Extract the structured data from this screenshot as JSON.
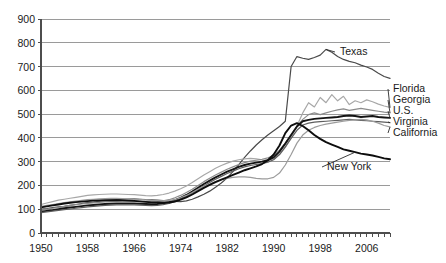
{
  "chart_data": {
    "type": "line",
    "title": "",
    "xlabel": "",
    "ylabel": "",
    "xlim": [
      1950,
      2010
    ],
    "ylim": [
      0,
      900
    ],
    "grid": true,
    "legend_position": "right-inline-labels",
    "y_ticks": [
      0,
      100,
      200,
      300,
      400,
      500,
      600,
      700,
      800,
      900
    ],
    "x_ticks_labeled": [
      1950,
      1958,
      1966,
      1974,
      1982,
      1990,
      1998,
      2006
    ],
    "x_tick_step_minor": 1,
    "x": [
      1950,
      1951,
      1952,
      1953,
      1954,
      1955,
      1956,
      1957,
      1958,
      1959,
      1960,
      1961,
      1962,
      1963,
      1964,
      1965,
      1966,
      1967,
      1968,
      1969,
      1970,
      1971,
      1972,
      1973,
      1974,
      1975,
      1976,
      1977,
      1978,
      1979,
      1980,
      1981,
      1982,
      1983,
      1984,
      1985,
      1986,
      1987,
      1988,
      1989,
      1990,
      1991,
      1992,
      1993,
      1994,
      1995,
      1996,
      1997,
      1998,
      1999,
      2000,
      2001,
      2002,
      2003,
      2004,
      2005,
      2006,
      2007,
      2008,
      2009,
      2010
    ],
    "series": [
      {
        "name": "Texas",
        "label": "Texas",
        "color": "#4a4a4a",
        "width": 1.2,
        "values": [
          100,
          103,
          107,
          110,
          112,
          116,
          120,
          124,
          128,
          130,
          133,
          136,
          138,
          140,
          142,
          143,
          144,
          142,
          140,
          139,
          138,
          136,
          134,
          133,
          132,
          135,
          142,
          152,
          163,
          176,
          192,
          210,
          232,
          258,
          288,
          318,
          345,
          370,
          392,
          412,
          430,
          448,
          470,
          700,
          742,
          735,
          730,
          738,
          748,
          772,
          760,
          742,
          730,
          722,
          716,
          706,
          698,
          688,
          672,
          658,
          650
        ]
      },
      {
        "name": "Florida",
        "label": "Florida",
        "color": "#a8a8a8",
        "width": 1.2,
        "values": [
          120,
          126,
          132,
          138,
          142,
          146,
          150,
          154,
          158,
          160,
          162,
          163,
          164,
          164,
          163,
          162,
          161,
          159,
          157,
          156,
          158,
          162,
          168,
          176,
          186,
          198,
          212,
          228,
          244,
          258,
          272,
          284,
          294,
          302,
          308,
          312,
          314,
          312,
          308,
          306,
          312,
          330,
          360,
          400,
          450,
          505,
          548,
          530,
          570,
          548,
          582,
          556,
          575,
          540,
          556,
          548,
          560,
          552,
          542,
          534,
          528
        ]
      },
      {
        "name": "Georgia",
        "label": "Georgia",
        "color": "#8c8c8c",
        "width": 1.2,
        "values": [
          96,
          100,
          104,
          108,
          112,
          116,
          119,
          122,
          125,
          127,
          129,
          131,
          132,
          133,
          134,
          134,
          134,
          133,
          132,
          131,
          132,
          135,
          140,
          148,
          158,
          170,
          184,
          200,
          216,
          230,
          244,
          256,
          268,
          278,
          288,
          296,
          302,
          306,
          310,
          316,
          326,
          348,
          378,
          412,
          448,
          478,
          498,
          505,
          498,
          505,
          512,
          518,
          522,
          516,
          520,
          524,
          520,
          516,
          512,
          508,
          505
        ]
      },
      {
        "name": "U.S.",
        "label": "U.S.",
        "color": "#141414",
        "width": 1.9,
        "values": [
          90,
          93,
          96,
          100,
          104,
          107,
          110,
          113,
          116,
          118,
          120,
          122,
          123,
          124,
          124,
          124,
          124,
          123,
          122,
          121,
          122,
          125,
          130,
          138,
          148,
          160,
          174,
          190,
          206,
          220,
          234,
          246,
          258,
          268,
          278,
          286,
          292,
          296,
          300,
          306,
          318,
          342,
          376,
          412,
          448,
          470,
          476,
          480,
          482,
          484,
          486,
          488,
          492,
          494,
          492,
          488,
          490,
          492,
          488,
          486,
          484
        ]
      },
      {
        "name": "Virginia",
        "label": "Virginia",
        "color": "#5e5e5e",
        "width": 1.2,
        "values": [
          86,
          89,
          92,
          95,
          98,
          101,
          104,
          107,
          110,
          112,
          114,
          116,
          117,
          118,
          118,
          118,
          118,
          117,
          116,
          115,
          116,
          119,
          124,
          132,
          142,
          154,
          168,
          184,
          198,
          212,
          226,
          238,
          250,
          260,
          270,
          278,
          284,
          288,
          292,
          298,
          308,
          330,
          362,
          398,
          432,
          454,
          462,
          466,
          468,
          470,
          472,
          474,
          476,
          478,
          476,
          474,
          472,
          470,
          468,
          466,
          464
        ]
      },
      {
        "name": "California",
        "label": "California",
        "color": "#9c9c9c",
        "width": 1.2,
        "values": [
          112,
          116,
          120,
          124,
          128,
          131,
          134,
          137,
          140,
          142,
          144,
          145,
          146,
          146,
          145,
          144,
          143,
          141,
          139,
          137,
          136,
          135,
          136,
          140,
          148,
          158,
          170,
          184,
          196,
          206,
          216,
          224,
          230,
          234,
          236,
          236,
          234,
          230,
          228,
          228,
          234,
          252,
          286,
          330,
          378,
          412,
          432,
          444,
          452,
          458,
          462,
          466,
          470,
          474,
          476,
          478,
          476,
          470,
          462,
          452,
          446
        ]
      },
      {
        "name": "New York",
        "label": "New York",
        "color": "#0d0d0d",
        "width": 1.9,
        "values": [
          108,
          112,
          116,
          120,
          124,
          127,
          130,
          132,
          134,
          136,
          137,
          138,
          138,
          138,
          137,
          136,
          135,
          133,
          131,
          129,
          128,
          127,
          128,
          132,
          140,
          150,
          162,
          176,
          190,
          202,
          214,
          224,
          234,
          244,
          254,
          264,
          272,
          280,
          290,
          306,
          330,
          368,
          420,
          452,
          462,
          450,
          432,
          412,
          396,
          382,
          372,
          362,
          352,
          346,
          340,
          334,
          330,
          326,
          320,
          314,
          310
        ]
      }
    ],
    "series_labels_right": [
      {
        "name": "Texas",
        "anchor_year": 1999,
        "anchor_value": 772,
        "label_x": 340,
        "label_y": 55
      },
      {
        "name": "Florida",
        "anchor_year": 2010,
        "anchor_value": 528,
        "label_x": 393,
        "label_y": 92
      },
      {
        "name": "Georgia",
        "anchor_year": 2010,
        "anchor_value": 505,
        "label_x": 393,
        "label_y": 103
      },
      {
        "name": "U.S.",
        "anchor_year": 2010,
        "anchor_value": 484,
        "label_x": 393,
        "label_y": 114
      },
      {
        "name": "Virginia",
        "anchor_year": 2010,
        "anchor_value": 464,
        "label_x": 393,
        "label_y": 125
      },
      {
        "name": "California",
        "anchor_year": 2010,
        "anchor_value": 446,
        "label_x": 393,
        "label_y": 136
      },
      {
        "name": "New York",
        "anchor_year": 2004,
        "anchor_value": 340,
        "label_x": 327,
        "label_y": 170
      }
    ]
  }
}
